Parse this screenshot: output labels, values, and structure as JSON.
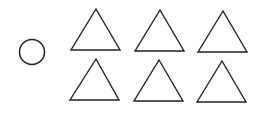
{
  "diagram": {
    "stroke_color": "#222222",
    "background": "#ffffff",
    "circle": {
      "cx": 32,
      "cy": 52,
      "r": 12.5
    },
    "triangles": [
      {
        "points": "96,9 71,50 120,50"
      },
      {
        "points": "160,10 135,51 184,51"
      },
      {
        "points": "223,11 198,52 247,52"
      },
      {
        "points": "96,59 70,100 119,100"
      },
      {
        "points": "159,60 134,101 183,101"
      },
      {
        "points": "222,61 197,102 246,102"
      }
    ]
  }
}
